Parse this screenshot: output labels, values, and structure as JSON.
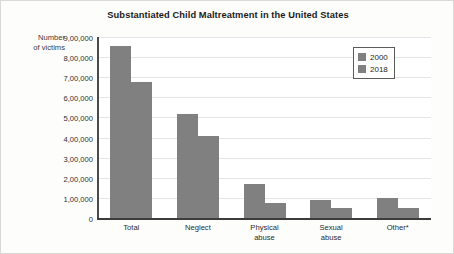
{
  "chart_data": {
    "type": "bar",
    "title": "Substantiated Child Maltreatment in the United States",
    "xlabel": "",
    "ylabel": "Number\nof victims",
    "ylabel_line1": "Number",
    "ylabel_line2": "of victims",
    "categories": [
      "Total",
      "Neglect",
      "Physical abuse",
      "Sexual abuse",
      "Other*"
    ],
    "category_labels": [
      {
        "line1": "Total",
        "line2": ""
      },
      {
        "line1": "Neglect",
        "line2": ""
      },
      {
        "line1": "Physical",
        "line2": "abuse"
      },
      {
        "line1": "Sexual",
        "line2": "abuse"
      },
      {
        "line1": "Other*",
        "line2": ""
      }
    ],
    "series": [
      {
        "name": "2000",
        "color": "#808080",
        "values": [
          860000,
          520000,
          175000,
          95000,
          105000
        ]
      },
      {
        "name": "2018",
        "color": "#808080",
        "values": [
          680000,
          415000,
          80000,
          57000,
          57000
        ]
      }
    ],
    "ylim": [
      0,
      900000
    ],
    "yticks": [
      0,
      100000,
      200000,
      300000,
      400000,
      500000,
      600000,
      700000,
      800000,
      900000
    ],
    "ytick_labels": [
      "0",
      "1,00,000",
      "2,00,000",
      "3,00,000",
      "4,00,000",
      "5,00,000",
      "6,00,000",
      "7,00,000",
      "8,00,000",
      "9,00,000"
    ],
    "grid": true,
    "grid_axis": "y",
    "legend_position": "top-right",
    "legend_entries": [
      "2000",
      "2018"
    ],
    "background_color": "#ffffff",
    "figure_background_color": "#fdfdfc",
    "axis_color": "#3c3c3c",
    "gridline_color": "#e3e6e6"
  }
}
